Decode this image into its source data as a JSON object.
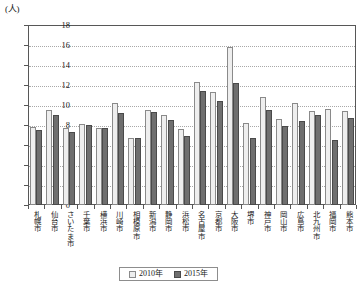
{
  "chart_data": {
    "type": "bar",
    "title": "",
    "subtitle": "",
    "xlabel": "",
    "ylabel": "",
    "unit_label": "(人)",
    "ylim": [
      0,
      18
    ],
    "ytick_step": 2,
    "yticks": [
      0,
      2,
      4,
      6,
      8,
      10,
      12,
      14,
      16,
      18
    ],
    "ytick_labels": [
      "0",
      "2",
      "4",
      "6",
      "8",
      "10",
      "12",
      "14",
      "16",
      "18"
    ],
    "grid": true,
    "grid_axis": "y",
    "legend_position": "bottom-center",
    "categories": [
      "札幌市",
      "仙台市",
      "さいたま市",
      "千葉市",
      "横浜市",
      "川崎市",
      "相模原市",
      "新潟市",
      "静岡市",
      "浜松市",
      "名古屋市",
      "京都市",
      "大阪市",
      "堺市",
      "神戸市",
      "岡山市",
      "広島市",
      "北九州市",
      "福岡市",
      "熊本市"
    ],
    "series": [
      {
        "name": "2010年",
        "color": "#eeeeee",
        "values": [
          7.8,
          9.5,
          7.7,
          8.1,
          7.7,
          10.2,
          6.7,
          9.5,
          9.0,
          7.6,
          12.3,
          11.3,
          15.8,
          8.2,
          10.8,
          8.6,
          10.2,
          9.4,
          9.6,
          9.4
        ]
      },
      {
        "name": "2015年",
        "color": "#6f6f6f",
        "values": [
          7.5,
          9.0,
          7.3,
          8.0,
          7.7,
          9.2,
          6.7,
          9.3,
          8.5,
          6.9,
          11.4,
          10.4,
          12.2,
          6.7,
          9.5,
          7.9,
          8.4,
          9.0,
          6.5,
          8.7
        ]
      }
    ]
  },
  "legend": {
    "items": [
      {
        "label": "2010年",
        "swatch": "light-gray-swatch"
      },
      {
        "label": "2015年",
        "swatch": "dark-gray-swatch"
      }
    ]
  },
  "colors": {
    "series_2010": "#eeeeee",
    "series_2015": "#6f6f6f",
    "axis": "#575757",
    "grid": "#a8a8a8",
    "text": "#1a1a1a",
    "background": "#ffffff"
  }
}
